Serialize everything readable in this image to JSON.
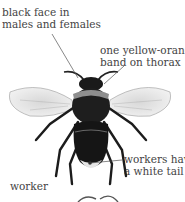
{
  "labels": {
    "face": [
      "black face in",
      "males and females"
    ],
    "thorax": [
      "one yellow-orange",
      "band on thorax"
    ],
    "tail": [
      "workers have",
      "a white tail"
    ],
    "caste": "worker"
  },
  "colors": {
    "text": "#444444",
    "leader": "#555555",
    "body": "#1a1a1a",
    "band": "#9a9a9a",
    "tail": "#e8e8e8"
  }
}
